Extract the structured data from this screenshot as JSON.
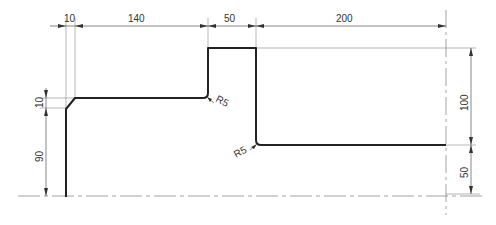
{
  "drawing": {
    "type": "stepped shaft half-section profile",
    "horizontal_dimensions": [
      {
        "label": "10",
        "from": "left-end",
        "to": "chamfer-end"
      },
      {
        "label": "140",
        "from": "chamfer-end",
        "to": "step-1"
      },
      {
        "label": "50",
        "from": "step-1",
        "to": "step-2"
      },
      {
        "label": "200",
        "from": "step-2",
        "to": "right-end"
      }
    ],
    "vertical_dimensions_left": [
      {
        "label": "10",
        "desc": "chamfer height"
      },
      {
        "label": "90",
        "desc": "left diameter radius to centerline"
      }
    ],
    "vertical_dimensions_right": [
      {
        "label": "100",
        "desc": "shoulder height"
      },
      {
        "label": "50",
        "desc": "right section radius to centerline"
      }
    ],
    "radius_labels": [
      {
        "label": "R5",
        "location": "inner corner at step-1"
      },
      {
        "label": "R5",
        "location": "inner corner at step-2"
      }
    ],
    "colors": {
      "profile": "#222222",
      "dimension": "#555555",
      "extension": "#9a9a9a",
      "centerline": "#8a8a8a"
    }
  }
}
